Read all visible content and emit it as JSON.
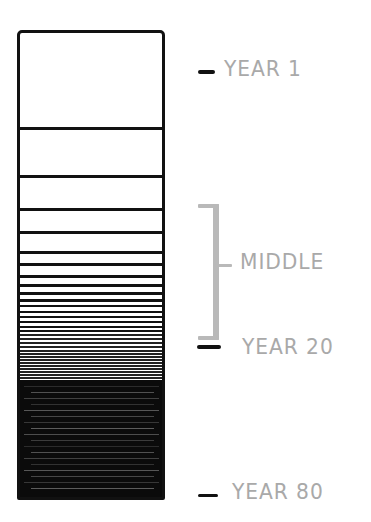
{
  "diagram": {
    "type": "life-calendar-bar",
    "colors": {
      "outline": "#111111",
      "filled": "#0b0b0b",
      "label": "#a9a9a9",
      "bracket": "#b9b9b9"
    },
    "box": {
      "top": 30,
      "bottom": 500
    },
    "row_lines_y": [
      127,
      175,
      208,
      231,
      251,
      263,
      275,
      284,
      292,
      299,
      305,
      311,
      316,
      321,
      326,
      330,
      334,
      338,
      342,
      346,
      350,
      353,
      356,
      359,
      362,
      365,
      368,
      371,
      374,
      377,
      380
    ],
    "filled_region": {
      "from_y": 383,
      "to_y": 500
    },
    "markers": [
      {
        "id": "year-1",
        "label": "YEAR 1",
        "y": 72
      },
      {
        "id": "year-20",
        "label": "YEAR 20",
        "y": 347
      },
      {
        "id": "year-80",
        "label": "YEAR 80",
        "y": 494
      }
    ],
    "bracket": {
      "label": "MIDDLE",
      "top_y": 205,
      "bottom_y": 338,
      "tick_y": 265
    }
  }
}
